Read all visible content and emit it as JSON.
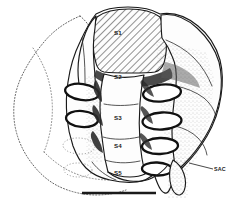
{
  "figure": {
    "background_color": "#ffffff",
    "ink_color": "#1a1a1a",
    "width": 243,
    "height": 212
  },
  "labels": {
    "segments": [
      {
        "id": "s1",
        "text": "S1",
        "x": 118,
        "y": 35,
        "note": "first sacral vertebra, hatched body"
      },
      {
        "id": "s2",
        "text": "S2",
        "x": 118,
        "y": 79,
        "note": "second sacral vertebra"
      },
      {
        "id": "s3",
        "text": "S3",
        "x": 118,
        "y": 120,
        "note": "third sacral vertebra"
      },
      {
        "id": "s4",
        "text": "S4",
        "x": 118,
        "y": 148,
        "note": "fourth sacral vertebra"
      },
      {
        "id": "s5",
        "text": "S5",
        "x": 118,
        "y": 175,
        "note": "fifth sacral vertebra"
      }
    ],
    "callouts": [
      {
        "id": "sac",
        "text": "SAC",
        "x": 224,
        "y": 170,
        "note": "sacral auricular/lateral crest annotation with leader line"
      }
    ]
  },
  "scale_bar": {
    "name": "scale-bar",
    "x1": 82,
    "x2": 156,
    "y": 193,
    "label": "",
    "thickness": 2.6,
    "color": "#1a1a1a"
  },
  "regions": {
    "hatched": {
      "name": "s1-body-hatching",
      "pattern": "diagonal-lines",
      "angle_deg": 45,
      "spacing_px": 4,
      "stroke": "#2a2a2a"
    },
    "dotted_outline": {
      "name": "left-ala-dotted-outline",
      "style": "dotted",
      "note": "reconstructed / obscured left sacral ala shown as dotted contour"
    },
    "foramina": {
      "name": "anterior-sacral-foramina",
      "right_count": 4,
      "left_count": 4,
      "left_lower_dotted": true
    }
  }
}
